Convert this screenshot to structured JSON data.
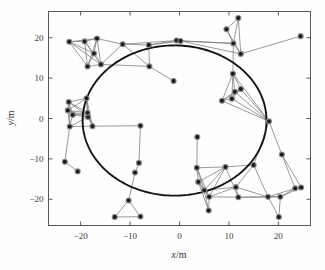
{
  "figure": {
    "background_color": "#fefefe",
    "frame_color": "#595959",
    "node_fill": "#1b1b1b",
    "node_edge": "#8a8a8a",
    "link_color": "#6f6f6f",
    "trajectory_color": "#141414"
  },
  "axes": {
    "x": {
      "label": "x/m",
      "label_italic": "x",
      "label_rest": "/m",
      "ticks": [
        -20,
        -10,
        0,
        10,
        20
      ],
      "tick_labels": [
        "−20",
        "−10",
        "0",
        "10",
        "20"
      ],
      "range": [
        -26.5,
        26.5
      ]
    },
    "y": {
      "label": "y/m",
      "label_italic": "y",
      "label_rest": "/m",
      "ticks": [
        20,
        10,
        0,
        -10,
        -20
      ],
      "tick_labels": [
        "20",
        "10",
        "0",
        "−10",
        "−20"
      ],
      "range": [
        -26.5,
        26.5
      ]
    }
  },
  "chart_data": {
    "type": "scatter",
    "title": "",
    "xlabel": "x/m",
    "ylabel": "y/m",
    "xlim": [
      -26.5,
      26.5
    ],
    "ylim": [
      -26.5,
      26.5
    ],
    "grid": false,
    "legend": null,
    "series": [
      {
        "name": "nodes",
        "marker": "circle",
        "points": [
          [
            -22.3,
            19.0
          ],
          [
            -19.2,
            19.1
          ],
          [
            -16.7,
            19.8
          ],
          [
            -11.5,
            18.4
          ],
          [
            -6.2,
            18.2
          ],
          [
            -0.6,
            19.3
          ],
          [
            0.2,
            19.2
          ],
          [
            -18.6,
            12.9
          ],
          [
            -17.3,
            16.1
          ],
          [
            -15.9,
            13.4
          ],
          [
            -6.1,
            12.9
          ],
          [
            -1.2,
            9.3
          ],
          [
            -22.4,
            4.1
          ],
          [
            -22.6,
            2.0
          ],
          [
            -21.6,
            0.9
          ],
          [
            -22.2,
            -2.0
          ],
          [
            -18.5,
            0.4
          ],
          [
            -18.8,
            5.0
          ],
          [
            -18.6,
            1.4
          ],
          [
            -17.6,
            -1.9
          ],
          [
            -7.9,
            -1.8
          ],
          [
            -8.2,
            -11.0
          ],
          [
            -9.0,
            -13.4
          ],
          [
            -23.2,
            -10.7
          ],
          [
            -20.6,
            -13.1
          ],
          [
            -10.3,
            -20.3
          ],
          [
            -13.1,
            -24.4
          ],
          [
            -7.9,
            -24.3
          ],
          [
            3.6,
            -4.6
          ],
          [
            3.5,
            -12.2
          ],
          [
            3.8,
            -15.7
          ],
          [
            5.0,
            -17.8
          ],
          [
            5.9,
            -22.8
          ],
          [
            6.0,
            -19.4
          ],
          [
            9.3,
            -12.0
          ],
          [
            11.9,
            -19.5
          ],
          [
            11.4,
            -17.0
          ],
          [
            15.0,
            -11.5
          ],
          [
            17.9,
            -19.4
          ],
          [
            20.1,
            -24.4
          ],
          [
            20.4,
            -19.4
          ],
          [
            20.7,
            -8.9
          ],
          [
            23.4,
            -17.3
          ],
          [
            24.6,
            -17.1
          ],
          [
            8.6,
            4.4
          ],
          [
            10.6,
            4.9
          ],
          [
            11.2,
            6.6
          ],
          [
            12.4,
            7.3
          ],
          [
            10.8,
            11.1
          ],
          [
            10.9,
            18.6
          ],
          [
            11.9,
            24.9
          ],
          [
            9.5,
            22.1
          ],
          [
            12.4,
            16.0
          ],
          [
            18.1,
            -0.7
          ],
          [
            24.5,
            20.4
          ]
        ]
      },
      {
        "name": "trajectory-arc",
        "type": "arc",
        "center": [
          -1.0,
          -0.5
        ],
        "radius": 18.6,
        "start_angle_deg": 88,
        "end_angle_deg": -328,
        "style": "thick-solid"
      }
    ],
    "links": [
      [
        0,
        1
      ],
      [
        0,
        2
      ],
      [
        0,
        7
      ],
      [
        0,
        8
      ],
      [
        0,
        9
      ],
      [
        1,
        2
      ],
      [
        1,
        7
      ],
      [
        1,
        8
      ],
      [
        1,
        9
      ],
      [
        2,
        3
      ],
      [
        2,
        8
      ],
      [
        2,
        9
      ],
      [
        3,
        4
      ],
      [
        3,
        5
      ],
      [
        3,
        9
      ],
      [
        3,
        10
      ],
      [
        4,
        5
      ],
      [
        4,
        10
      ],
      [
        5,
        6
      ],
      [
        6,
        52
      ],
      [
        7,
        8
      ],
      [
        7,
        9
      ],
      [
        8,
        9
      ],
      [
        9,
        10
      ],
      [
        10,
        11
      ],
      [
        4,
        6
      ],
      [
        2,
        7
      ],
      [
        12,
        13
      ],
      [
        12,
        14
      ],
      [
        12,
        15
      ],
      [
        12,
        16
      ],
      [
        12,
        17
      ],
      [
        12,
        18
      ],
      [
        13,
        14
      ],
      [
        13,
        15
      ],
      [
        13,
        16
      ],
      [
        13,
        17
      ],
      [
        13,
        18
      ],
      [
        14,
        15
      ],
      [
        14,
        16
      ],
      [
        14,
        18
      ],
      [
        15,
        16
      ],
      [
        15,
        19
      ],
      [
        16,
        17
      ],
      [
        16,
        18
      ],
      [
        16,
        19
      ],
      [
        17,
        18
      ],
      [
        17,
        19
      ],
      [
        18,
        19
      ],
      [
        19,
        20
      ],
      [
        15,
        23
      ],
      [
        23,
        24
      ],
      [
        20,
        21
      ],
      [
        21,
        22
      ],
      [
        22,
        25
      ],
      [
        25,
        26
      ],
      [
        25,
        27
      ],
      [
        26,
        27
      ],
      [
        28,
        29
      ],
      [
        29,
        30
      ],
      [
        29,
        31
      ],
      [
        29,
        33
      ],
      [
        29,
        34
      ],
      [
        30,
        31
      ],
      [
        30,
        32
      ],
      [
        30,
        33
      ],
      [
        30,
        34
      ],
      [
        31,
        32
      ],
      [
        31,
        33
      ],
      [
        31,
        34
      ],
      [
        32,
        33
      ],
      [
        33,
        34
      ],
      [
        33,
        35
      ],
      [
        34,
        35
      ],
      [
        34,
        37
      ],
      [
        35,
        36
      ],
      [
        35,
        38
      ],
      [
        36,
        37
      ],
      [
        36,
        38
      ],
      [
        37,
        38
      ],
      [
        38,
        39
      ],
      [
        38,
        40
      ],
      [
        38,
        42
      ],
      [
        39,
        40
      ],
      [
        40,
        42
      ],
      [
        40,
        43
      ],
      [
        41,
        42
      ],
      [
        41,
        43
      ],
      [
        42,
        43
      ],
      [
        35,
        40
      ],
      [
        33,
        36
      ],
      [
        31,
        36
      ],
      [
        44,
        45
      ],
      [
        44,
        46
      ],
      [
        44,
        47
      ],
      [
        44,
        48
      ],
      [
        45,
        46
      ],
      [
        45,
        47
      ],
      [
        45,
        48
      ],
      [
        46,
        47
      ],
      [
        46,
        48
      ],
      [
        47,
        48
      ],
      [
        48,
        49
      ],
      [
        49,
        50
      ],
      [
        49,
        51
      ],
      [
        49,
        52
      ],
      [
        50,
        51
      ],
      [
        50,
        52
      ],
      [
        51,
        52
      ],
      [
        52,
        54
      ],
      [
        44,
        53
      ],
      [
        45,
        53
      ],
      [
        46,
        53
      ],
      [
        47,
        53
      ],
      [
        48,
        53
      ],
      [
        53,
        41
      ],
      [
        37,
        53
      ],
      [
        5,
        49
      ],
      [
        6,
        49
      ]
    ]
  }
}
